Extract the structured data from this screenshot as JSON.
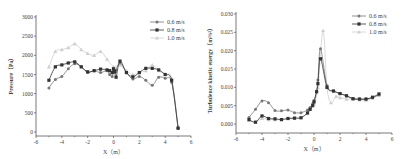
{
  "chart_data": [
    {
      "type": "line",
      "title": "",
      "xlabel": "X（m）",
      "ylabel": "Pressure（Pa）",
      "xlim": [
        -6,
        6
      ],
      "ylim": [
        0,
        3000
      ],
      "xticks": [
        -6,
        -4,
        -2,
        0,
        2,
        4,
        6
      ],
      "yticks": [
        0,
        500,
        1000,
        1500,
        2000,
        2500,
        3000
      ],
      "grid": false,
      "legend_position": "upper right",
      "series": [
        {
          "name": "0.6 m/s",
          "color": "#777777",
          "marker": "circle",
          "x": [
            -5,
            -4.5,
            -4,
            -3.5,
            -3,
            -2.5,
            -2,
            -1.5,
            -1,
            -0.5,
            -0.3,
            -0.1,
            0,
            0.1,
            0.2,
            0.5,
            1,
            1.5,
            2,
            2.5,
            3,
            3.5,
            4,
            4.5,
            5
          ],
          "y": [
            1150,
            1370,
            1450,
            1650,
            1780,
            1700,
            1550,
            1600,
            1550,
            1600,
            1500,
            1450,
            1600,
            1550,
            1620,
            1800,
            1550,
            1380,
            1450,
            1350,
            1220,
            1430,
            1400,
            1300,
            100
          ]
        },
        {
          "name": "0.8 m/s",
          "color": "#333333",
          "marker": "square",
          "x": [
            -5,
            -4.5,
            -4,
            -3.5,
            -3,
            -2.5,
            -2,
            -1.5,
            -1,
            -0.5,
            -0.3,
            -0.1,
            0,
            0.1,
            0.2,
            0.5,
            1,
            1.5,
            2,
            2.5,
            3,
            3.5,
            4,
            4.5,
            5
          ],
          "y": [
            1350,
            1700,
            1750,
            1800,
            1830,
            1700,
            1570,
            1600,
            1640,
            1620,
            1600,
            1550,
            1650,
            1580,
            1430,
            1850,
            1550,
            1440,
            1550,
            1660,
            1660,
            1620,
            1500,
            1350,
            100
          ]
        },
        {
          "name": "1.0 m/s",
          "color": "#cfcfcf",
          "marker": "triangle",
          "x": [
            -5,
            -4.5,
            -4,
            -3.5,
            -3,
            -2.5,
            -2,
            -1.5,
            -1,
            -0.5,
            0,
            0.5,
            1,
            1.5,
            2,
            2.5,
            3,
            3.5,
            4,
            4.5,
            5
          ],
          "y": [
            1700,
            2100,
            2150,
            2200,
            2300,
            2150,
            2050,
            2000,
            2100,
            1900,
            1700,
            1750,
            1600,
            1500,
            1550,
            1600,
            1750,
            1600,
            1500,
            1400,
            150
          ]
        }
      ]
    },
    {
      "type": "line",
      "title": "",
      "xlabel": "X（m）",
      "ylabel": "Turbulence kinetic energy（m²/s²）",
      "xlim": [
        -6,
        6
      ],
      "ylim": [
        0,
        0.03
      ],
      "xticks": [
        -6,
        -4,
        -2,
        0,
        2,
        4,
        6
      ],
      "yticks": [
        0.0,
        0.005,
        0.01,
        0.015,
        0.02,
        0.025,
        0.03
      ],
      "grid": false,
      "legend_position": "upper right",
      "series": [
        {
          "name": "0.6 m/s",
          "color": "#777777",
          "marker": "circle",
          "x": [
            -5,
            -4.5,
            -4,
            -3.5,
            -3,
            -2.5,
            -2,
            -1.5,
            -1,
            -0.5,
            -0.3,
            -0.1,
            0,
            0.2,
            0.3,
            0.5,
            1,
            1.5,
            2,
            2.5,
            3,
            3.5,
            4,
            4.5,
            5
          ],
          "y": [
            0.0018,
            0.004,
            0.0063,
            0.0058,
            0.0037,
            0.0036,
            0.0038,
            0.0031,
            0.0031,
            0.0038,
            0.0045,
            0.0055,
            0.0064,
            0.009,
            0.012,
            0.0205,
            0.0105,
            0.009,
            0.0083,
            0.0077,
            0.0069,
            0.0068,
            0.0068,
            0.0072,
            0.008
          ]
        },
        {
          "name": "0.8 m/s",
          "color": "#333333",
          "marker": "square",
          "x": [
            -5,
            -4.5,
            -4,
            -3.5,
            -3,
            -2.5,
            -2,
            -1.5,
            -1,
            -0.5,
            -0.3,
            -0.1,
            0,
            0.2,
            0.3,
            0.5,
            1,
            1.5,
            2,
            2.5,
            3,
            3.5,
            4,
            4.5,
            5
          ],
          "y": [
            0.0012,
            0.0005,
            0.0022,
            0.0015,
            0.0014,
            0.0012,
            0.0015,
            0.0016,
            0.0017,
            0.003,
            0.004,
            0.005,
            0.006,
            0.0088,
            0.011,
            0.0178,
            0.01,
            0.009,
            0.0083,
            0.0077,
            0.0069,
            0.0068,
            0.0068,
            0.0073,
            0.0082
          ]
        },
        {
          "name": "1.0 m/s",
          "color": "#cfcfcf",
          "marker": "triangle",
          "x": [
            -5,
            -4.5,
            -4,
            -3.5,
            -3,
            -2.5,
            -2,
            -1.5,
            -1,
            -0.5,
            0,
            0.3,
            0.7,
            1,
            1.3,
            1.7,
            2,
            2.5,
            3,
            3.5,
            4,
            4.5,
            5
          ],
          "y": [
            0.001,
            0.0005,
            0.0015,
            0.0012,
            0.0012,
            0.0012,
            0.0015,
            0.0016,
            0.0018,
            0.003,
            0.0055,
            0.01,
            0.0255,
            0.01,
            0.0058,
            0.0075,
            0.0072,
            0.0068,
            0.0068,
            0.0066,
            0.0065,
            0.007,
            0.0078
          ]
        }
      ]
    }
  ]
}
